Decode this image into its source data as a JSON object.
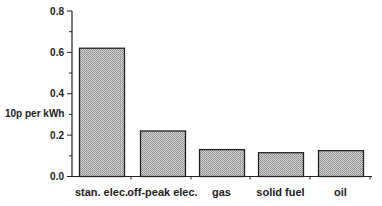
{
  "chart_data": {
    "type": "bar",
    "title": "",
    "xlabel": "",
    "ylabel": "10p per kWh",
    "categories": [
      "stan. elec.",
      "off-peak elec.",
      "gas",
      "solid fuel",
      "oil"
    ],
    "values": [
      0.62,
      0.22,
      0.13,
      0.115,
      0.125
    ],
    "ylim": [
      0.0,
      0.8
    ],
    "yticks": [
      "0.0",
      "0.2",
      "0.4",
      "0.6",
      "0.8"
    ],
    "grid": false,
    "legend": null,
    "bar_fill": "#b8b8b8",
    "bar_stroke": "#222222"
  }
}
